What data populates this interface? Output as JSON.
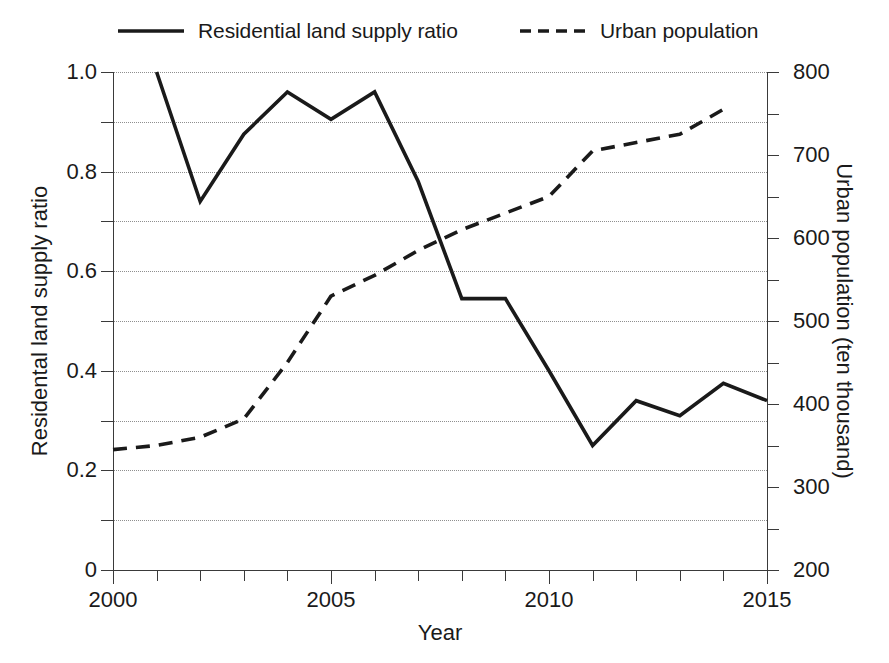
{
  "legend": {
    "position": "top",
    "entries": [
      {
        "label": "Residential land supply ratio",
        "style": "solid",
        "swatch": "solid-line-swatch"
      },
      {
        "label": "Urban population",
        "style": "dashed",
        "swatch": "dashed-line-swatch"
      }
    ]
  },
  "axes": {
    "x_title": "Year",
    "y_left_title": "Residental land supply ratio",
    "y_right_title": "Urban population (ten thousand)",
    "x_ticks": [
      "2000",
      "2005",
      "2010",
      "2015"
    ],
    "y_left_ticks": [
      "0",
      "0.2",
      "0.4",
      "0.6",
      "0.8",
      "1.0"
    ],
    "y_right_ticks": [
      "200",
      "300",
      "400",
      "500",
      "600",
      "700",
      "800"
    ]
  },
  "chart_data": {
    "type": "line",
    "title": "",
    "xlabel": "Year",
    "ylabel": "Residental land supply ratio",
    "y2label": "Urban population (ten thousand)",
    "xlim": [
      2000,
      2015
    ],
    "ylim": [
      0,
      1.0
    ],
    "y2lim": [
      200,
      800
    ],
    "grid": true,
    "legend_position": "top",
    "x": [
      2000,
      2001,
      2002,
      2003,
      2004,
      2005,
      2006,
      2007,
      2008,
      2009,
      2010,
      2011,
      2012,
      2013,
      2014,
      2015
    ],
    "series": [
      {
        "name": "Residential land supply ratio",
        "axis": "left",
        "style": "solid",
        "color": "#1a1a1a",
        "x": [
          2001,
          2002,
          2003,
          2004,
          2005,
          2006,
          2007,
          2008,
          2009,
          2010,
          2011,
          2012,
          2013,
          2014,
          2015
        ],
        "values": [
          1.0,
          0.74,
          0.875,
          0.96,
          0.905,
          0.96,
          0.78,
          0.545,
          0.545,
          0.4,
          0.25,
          0.34,
          0.31,
          0.375,
          0.34
        ]
      },
      {
        "name": "Urban population",
        "axis": "right",
        "style": "dashed",
        "color": "#1a1a1a",
        "x": [
          2000,
          2001,
          2002,
          2003,
          2004,
          2005,
          2006,
          2007,
          2008,
          2009,
          2010,
          2011,
          2012,
          2013,
          2014
        ],
        "values": [
          345,
          350,
          360,
          382,
          450,
          530,
          555,
          585,
          610,
          630,
          650,
          705,
          715,
          725,
          755
        ]
      }
    ]
  },
  "colors": {
    "line": "#1a1a1a",
    "axis": "#3a3a3a",
    "grid": "#8f8f8f",
    "background": "#ffffff"
  }
}
